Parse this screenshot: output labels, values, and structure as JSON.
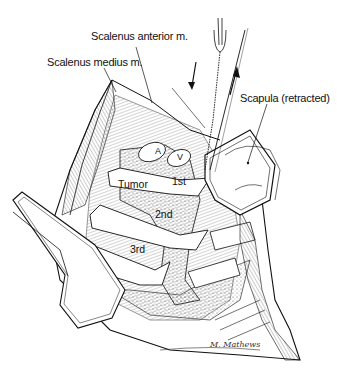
{
  "figure": {
    "type": "surgical-illustration",
    "labels": {
      "scalenus_anterior": "Scalenus anterior m.",
      "scalenus_medius": "Scalenus medius m.",
      "scapula": "Scapula (retracted)",
      "tumor": "Tumor",
      "rib_1": "1st",
      "rib_2": "2nd",
      "rib_3": "3rd",
      "artery": "A",
      "vein": "V"
    },
    "signature": "M. Mathews",
    "colors": {
      "ink": "#111111",
      "background": "#ffffff"
    }
  }
}
